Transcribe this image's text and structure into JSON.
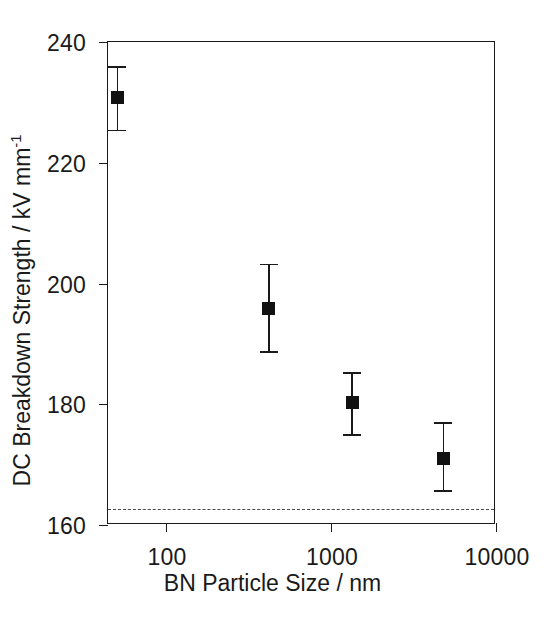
{
  "chart_data": {
    "type": "scatter",
    "title": "",
    "xlabel": "BN Particle Size / nm",
    "ylabel_text": "DC Breakdown Strength / kV mm",
    "ylabel_superscript": "-1",
    "ylabel_full": "DC Breakdown Strength / kV mm-1",
    "x_scale": "log",
    "y_scale": "linear",
    "xlim": [
      60,
      10000
    ],
    "ylim": [
      160,
      240
    ],
    "grid": false,
    "legend": null,
    "x_ticks": [
      100,
      1000,
      10000
    ],
    "x_tick_labels": [
      "100",
      "1000",
      "10000"
    ],
    "y_ticks": [
      160,
      180,
      200,
      220,
      240
    ],
    "y_tick_labels": [
      "160",
      "180",
      "200",
      "220",
      "240"
    ],
    "marker_style": "filled-square",
    "marker_color": "#111111",
    "error_bar_style": "capped-vertical",
    "points": [
      {
        "x": 68,
        "y": 230.8,
        "yerr_low": 225.5,
        "yerr_high": 236.0,
        "x_label": "68",
        "y_label": "230.8"
      },
      {
        "x": 500,
        "y": 195.8,
        "yerr_low": 188.8,
        "yerr_high": 203.3,
        "x_label": "500",
        "y_label": "195.8"
      },
      {
        "x": 1500,
        "y": 180.3,
        "yerr_low": 175.0,
        "yerr_high": 185.3,
        "x_label": "1500",
        "y_label": "180.3"
      },
      {
        "x": 5000,
        "y": 171.0,
        "yerr_low": 165.8,
        "yerr_high": 177.0,
        "x_label": "5000",
        "y_label": "171.0"
      }
    ],
    "reference_line": {
      "value": 162.7,
      "style": "dashed",
      "color": "#4a4a4a",
      "label": ""
    },
    "axis_color": "#1a1a1a",
    "background_color": "#ffffff"
  }
}
